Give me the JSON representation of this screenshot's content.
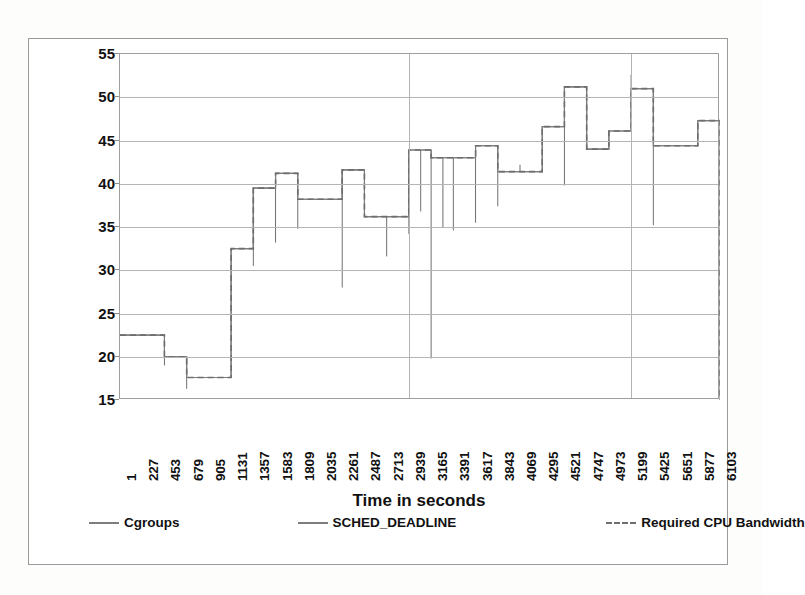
{
  "chart_data": {
    "type": "line",
    "title": "",
    "xlabel": "Time in seconds",
    "ylabel": "Cpu Bandwidth %",
    "ylim": [
      15,
      55
    ],
    "ytick_labels": [
      "55",
      "50",
      "45",
      "40",
      "35",
      "30",
      "25",
      "20",
      "15"
    ],
    "yticks": [
      55,
      50,
      45,
      40,
      35,
      30,
      25,
      20,
      15
    ],
    "xlim": [
      1,
      6103
    ],
    "grid": true,
    "legend_position": "bottom",
    "xtick_labels": [
      "1",
      "227",
      "453",
      "679",
      "905",
      "1131",
      "1357",
      "1583",
      "1809",
      "2035",
      "2261",
      "2487",
      "2713",
      "2939",
      "3165",
      "3391",
      "3617",
      "3843",
      "4069",
      "4295",
      "4521",
      "4747",
      "4973",
      "5199",
      "5425",
      "5651",
      "5877",
      "6103"
    ],
    "x": [
      1,
      227,
      453,
      679,
      905,
      1131,
      1357,
      1583,
      1809,
      2035,
      2261,
      2487,
      2713,
      2939,
      3165,
      3391,
      3617,
      3843,
      4069,
      4295,
      4521,
      4747,
      4973,
      5199,
      5425,
      5651,
      5877,
      6103
    ],
    "series": [
      {
        "name": "Cgroups",
        "style": "solid",
        "color": "#7d7d7d",
        "values": [
          22.5,
          22.5,
          20.0,
          17.6,
          17.6,
          32.5,
          39.5,
          41.2,
          38.2,
          38.2,
          41.6,
          36.2,
          36.2,
          43.9,
          43.0,
          43.0,
          44.4,
          41.4,
          41.4,
          46.6,
          51.2,
          44.0,
          46.1,
          51.0,
          44.4,
          44.4,
          47.3,
          47.3
        ]
      },
      {
        "name": "SCHED_DEADLINE",
        "style": "solid",
        "color": "#6f6f6f",
        "values": [
          22.5,
          22.5,
          20.0,
          17.6,
          17.6,
          32.5,
          39.5,
          41.2,
          38.2,
          38.2,
          41.6,
          36.2,
          36.2,
          43.9,
          43.0,
          43.0,
          44.4,
          41.4,
          41.4,
          46.6,
          51.2,
          44.0,
          46.1,
          51.0,
          44.4,
          44.4,
          47.3,
          47.3
        ],
        "spikes": [
          {
            "x": 453,
            "low": 19.0
          },
          {
            "x": 679,
            "low": 16.3
          },
          {
            "x": 1357,
            "low": 30.5
          },
          {
            "x": 1583,
            "low": 33.2
          },
          {
            "x": 1809,
            "low": 34.8
          },
          {
            "x": 2261,
            "low": 28.0
          },
          {
            "x": 2713,
            "low": 31.6
          },
          {
            "x": 2939,
            "low": 34.2
          },
          {
            "x": 3059,
            "low": 36.8
          },
          {
            "x": 3165,
            "low": 19.8
          },
          {
            "x": 3285,
            "low": 35.0
          },
          {
            "x": 3391,
            "low": 34.6
          },
          {
            "x": 3617,
            "low": 35.5
          },
          {
            "x": 3843,
            "low": 37.4
          },
          {
            "x": 4069,
            "low": 42.2
          },
          {
            "x": 4521,
            "low": 39.8
          },
          {
            "x": 4747,
            "low": 45.2
          },
          {
            "x": 5199,
            "low": 52.6
          },
          {
            "x": 5425,
            "low": 35.2
          }
        ]
      },
      {
        "name": "Required CPU Bandwidth",
        "style": "dashed",
        "color": "#6e6e6e",
        "values": [
          22.5,
          22.5,
          20.0,
          17.6,
          17.6,
          32.5,
          39.5,
          41.2,
          38.2,
          38.2,
          41.6,
          36.2,
          36.2,
          43.9,
          43.0,
          43.0,
          44.4,
          41.4,
          41.4,
          46.6,
          51.2,
          44.0,
          46.1,
          51.0,
          44.4,
          44.4,
          47.3,
          47.3
        ]
      }
    ]
  },
  "legend": {
    "items": [
      {
        "label": "Cgroups",
        "style": "solid"
      },
      {
        "label": "SCHED_DEADLINE",
        "style": "solid"
      },
      {
        "label": "Required CPU Bandwidth",
        "style": "dashed"
      }
    ]
  }
}
